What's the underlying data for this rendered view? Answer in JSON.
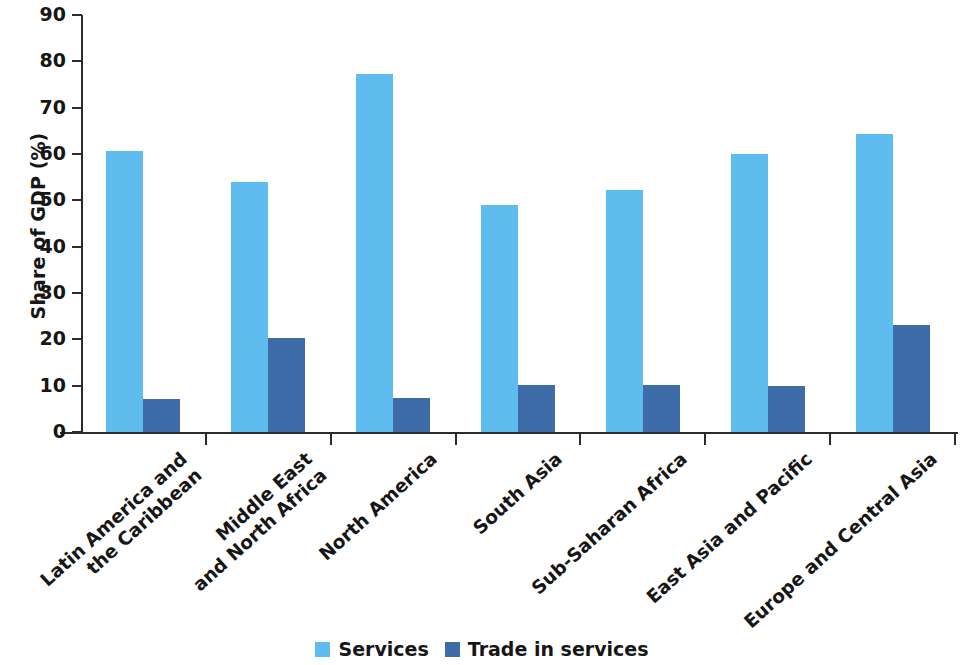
{
  "chart_data": {
    "type": "bar",
    "title": "",
    "xlabel": "",
    "ylabel": "Share of GDP (%)",
    "ylim": [
      0,
      90
    ],
    "ytick_step": 10,
    "yticks": [
      0,
      10,
      20,
      30,
      40,
      50,
      60,
      70,
      80,
      90
    ],
    "grid": false,
    "legend_position": "bottom-center",
    "categories": [
      "Latin America and the Caribbean",
      "Middle East and North Africa",
      "North America",
      "South Asia",
      "Sub-Saharan Africa",
      "East Asia and Pacific",
      "Europe and Central Asia"
    ],
    "category_lines": [
      [
        "Latin America and",
        "the Caribbean"
      ],
      [
        "Middle East",
        "and North Africa"
      ],
      [
        "North America"
      ],
      [
        "South Asia"
      ],
      [
        "Sub-Saharan Africa"
      ],
      [
        "East Asia and Pacific"
      ],
      [
        "Europe and Central Asia"
      ]
    ],
    "series": [
      {
        "name": "Services",
        "color": "#5fbcef",
        "values": [
          60.7,
          54.0,
          77.3,
          48.9,
          52.2,
          60.0,
          64.3
        ]
      },
      {
        "name": "Trade in services",
        "color": "#3e6ca8",
        "values": [
          7.2,
          20.2,
          7.3,
          10.2,
          10.2,
          10.0,
          23.0
        ]
      }
    ]
  },
  "legend": {
    "items": [
      {
        "label": "Services",
        "color": "#5fbcef"
      },
      {
        "label": "Trade in services",
        "color": "#3e6ca8"
      }
    ]
  }
}
